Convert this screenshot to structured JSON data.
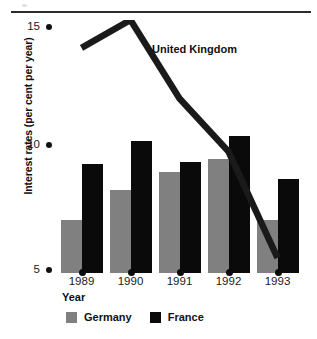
{
  "chart_data": {
    "type": "bar",
    "title": "",
    "subtitle": "",
    "xlabel": "Year",
    "ylabel": "Interest rates (per cent per year)",
    "categories": [
      "1989",
      "1990",
      "1991",
      "1992",
      "1993"
    ],
    "ylim": [
      5,
      15
    ],
    "yticks": [
      5,
      10,
      15
    ],
    "ytick_labels": [
      "5",
      "10",
      "15"
    ],
    "grid": false,
    "legend_position": "bottom",
    "series": [
      {
        "name": "Germany",
        "render": "bar",
        "color": "#808080",
        "values": [
          7.1,
          8.3,
          9.0,
          9.5,
          7.1
        ]
      },
      {
        "name": "France",
        "render": "bar",
        "color": "#0a0a0a",
        "values": [
          9.3,
          10.2,
          9.4,
          10.4,
          8.7
        ]
      },
      {
        "name": "United Kingdom",
        "render": "line",
        "color": "#1a1a1a",
        "values": [
          13.9,
          15.0,
          11.9,
          9.8,
          5.6
        ]
      }
    ],
    "annotations": [
      {
        "text": "United Kingdom",
        "series": "United Kingdom"
      }
    ]
  },
  "axis": {
    "y_title": "Interest rates (per cent per year)",
    "x_title": "Year",
    "y_ticks": [
      {
        "label": "15"
      },
      {
        "label": "10"
      },
      {
        "label": "5"
      }
    ],
    "x_ticks": [
      {
        "label": "1989"
      },
      {
        "label": "1990"
      },
      {
        "label": "1991"
      },
      {
        "label": "1992"
      },
      {
        "label": "1993"
      }
    ]
  },
  "legend": {
    "items": [
      {
        "label": "Germany",
        "color": "#808080"
      },
      {
        "label": "France",
        "color": "#0a0a0a"
      }
    ]
  },
  "annotations": {
    "uk_label": "United Kingdom"
  }
}
